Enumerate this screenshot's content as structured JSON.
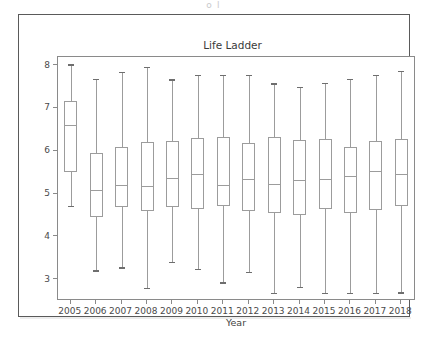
{
  "caption_strip": "o                                    l",
  "figure": {
    "title": "Life Ladder",
    "x_axis_label": "Year"
  },
  "chart_data": {
    "type": "box",
    "title": "Life Ladder",
    "xlabel": "Year",
    "ylabel": "",
    "ylim": [
      2.55,
      8.2
    ],
    "yticks": [
      3,
      4,
      5,
      6,
      7,
      8
    ],
    "ytick_labels": [
      "3",
      "4",
      "5",
      "6",
      "7",
      "8"
    ],
    "grid": false,
    "legend": null,
    "categories": [
      "2005",
      "2006",
      "2007",
      "2008",
      "2009",
      "2010",
      "2011",
      "2012",
      "2013",
      "2014",
      "2015",
      "2016",
      "2017",
      "2018"
    ],
    "boxes": [
      {
        "category": "2005",
        "whisker_low": 4.73,
        "q1": 5.52,
        "median": 6.62,
        "q3": 7.17,
        "whisker_high": 8.03
      },
      {
        "category": "2006",
        "whisker_low": 3.22,
        "q1": 4.46,
        "median": 5.09,
        "q3": 5.96,
        "whisker_high": 7.69
      },
      {
        "category": "2007",
        "whisker_low": 3.29,
        "q1": 4.69,
        "median": 5.22,
        "q3": 6.1,
        "whisker_high": 7.85
      },
      {
        "category": "2008",
        "whisker_low": 2.81,
        "q1": 4.6,
        "median": 5.18,
        "q3": 6.22,
        "whisker_high": 7.97
      },
      {
        "category": "2009",
        "whisker_low": 3.42,
        "q1": 4.69,
        "median": 5.37,
        "q3": 6.25,
        "whisker_high": 7.68
      },
      {
        "category": "2010",
        "whisker_low": 3.25,
        "q1": 4.65,
        "median": 5.46,
        "q3": 6.3,
        "whisker_high": 7.79
      },
      {
        "category": "2011",
        "whisker_low": 2.94,
        "q1": 4.71,
        "median": 5.22,
        "q3": 6.33,
        "whisker_high": 7.79
      },
      {
        "category": "2012",
        "whisker_low": 3.18,
        "q1": 4.61,
        "median": 5.34,
        "q3": 6.2,
        "whisker_high": 7.78
      },
      {
        "category": "2013",
        "whisker_low": 2.69,
        "q1": 4.55,
        "median": 5.23,
        "q3": 6.33,
        "whisker_high": 7.59
      },
      {
        "category": "2014",
        "whisker_low": 2.84,
        "q1": 4.52,
        "median": 5.33,
        "q3": 6.27,
        "whisker_high": 7.51
      },
      {
        "category": "2015",
        "whisker_low": 2.7,
        "q1": 4.64,
        "median": 5.35,
        "q3": 6.28,
        "whisker_high": 7.6
      },
      {
        "category": "2016",
        "whisker_low": 2.69,
        "q1": 4.55,
        "median": 5.43,
        "q3": 6.11,
        "whisker_high": 7.69
      },
      {
        "category": "2017",
        "whisker_low": 2.69,
        "q1": 4.62,
        "median": 5.55,
        "q3": 6.25,
        "whisker_high": 7.79
      },
      {
        "category": "2018",
        "whisker_low": 2.71,
        "q1": 4.73,
        "median": 5.48,
        "q3": 6.28,
        "whisker_high": 7.88
      }
    ]
  },
  "colors": {
    "box_stroke": "#9c9c9c",
    "cap_stroke": "#6e6e6e",
    "axis_stroke": "#8a8a8a",
    "frame_stroke": "#5a5a5a",
    "text": "#3a3a3a",
    "background": "#ffffff"
  }
}
